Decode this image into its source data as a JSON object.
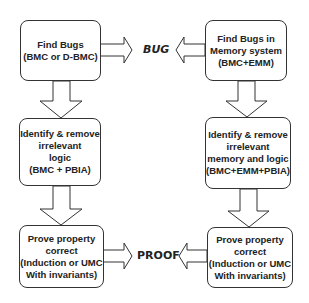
{
  "diagram": {
    "left_column": [
      {
        "lines": [
          "Find Bugs",
          "(BMC or D-BMC)"
        ]
      },
      {
        "lines": [
          "Identify & remove",
          "irrelevant",
          "logic",
          "(BMC + PBIA)"
        ]
      },
      {
        "lines": [
          "Prove property",
          "correct",
          "(Induction or UMC",
          "With  invariants)"
        ]
      }
    ],
    "right_column": [
      {
        "lines": [
          "Find Bugs in",
          "Memory system",
          "(BMC+EMM)"
        ]
      },
      {
        "lines": [
          "Identify & remove",
          "irrelevant",
          "memory and logic",
          "(BMC+EMM+PBIA)"
        ]
      },
      {
        "lines": [
          "Prove property",
          "correct",
          "(Induction or UMC",
          "With  invariants)"
        ]
      }
    ],
    "outcomes": {
      "bug": "BUG",
      "proof": "PROOF"
    }
  }
}
